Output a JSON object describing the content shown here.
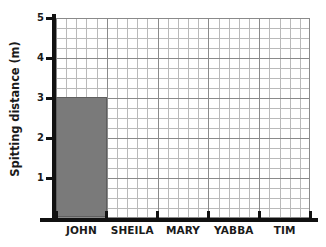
{
  "chart_data": {
    "type": "bar",
    "title": "",
    "xlabel": "",
    "ylabel": "Spitting distance (m)",
    "categories": [
      "JOHN",
      "SHEILA",
      "MARY",
      "YABBA",
      "TIM"
    ],
    "values": [
      3,
      null,
      null,
      null,
      null
    ],
    "ylim": [
      0,
      5
    ],
    "yticks": [
      1,
      2,
      3,
      4,
      5
    ],
    "ytick_labels": [
      "1",
      "2",
      "3",
      "4",
      "5"
    ],
    "minor_y_divisions": 4,
    "minor_x_divisions": 5,
    "grid": true,
    "legend": null,
    "series": [
      {
        "name": "Spitting distance",
        "values": [
          3,
          null,
          null,
          null,
          null
        ],
        "color": "#7a7a7a"
      }
    ],
    "bars": [
      {
        "category": "JOHN",
        "value": 3,
        "color": "#7a7a7a"
      }
    ],
    "colors": {
      "bar_fill": "#7a7a7a",
      "bar_edge": "#5f5f5f",
      "axis": "#111111",
      "major_grid": "#8a8a8a",
      "minor_grid": "#b9b9b9",
      "text": "#1a1a1a",
      "background": "#ffffff"
    }
  }
}
